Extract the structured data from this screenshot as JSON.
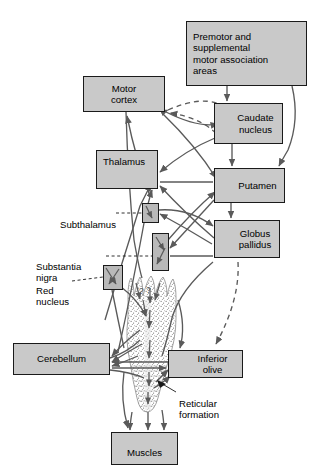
{
  "figure": {
    "kind": "neuroanatomy-pathway-diagram",
    "width": 323,
    "height": 469,
    "colors": {
      "box_fill": "#c9c9c9",
      "nucleus_fill": "#b9b9b9",
      "stroke": "#1a1a1a",
      "arrow": "#5a5a5a",
      "background": "#ffffff",
      "stipple": "#7a7a7a"
    }
  },
  "nodes": {
    "premotor": {
      "label": "Premotor and\nsupplemental\nmotor association\nareas"
    },
    "motor_cortex": {
      "label": "Motor\ncortex"
    },
    "caudate": {
      "label": "Caudate\nnucleus"
    },
    "thalamus": {
      "label": "Thalamus"
    },
    "putamen": {
      "label": "Putamen"
    },
    "globus_pallidus": {
      "label": "Globus\npallidus"
    },
    "cerebellum": {
      "label": "Cerebellum"
    },
    "inferior_olive": {
      "label": "Inferior\nolive"
    },
    "muscles": {
      "label": "Muscles"
    }
  },
  "nuclei": {
    "subthalamus": {
      "label": "Subthalamus"
    },
    "substantia_nigra": {
      "label": "Substantia\nnigra"
    },
    "red_nucleus": {
      "label": "Red\nnucleus"
    }
  },
  "annotations": {
    "reticular_formation": {
      "label": "Reticular\nformation"
    }
  },
  "icons": {
    "leader_line": "dashed-leader-line-icon",
    "arrowhead": "triangle-arrowhead-icon",
    "brainstem": "brainstem-spinal-cord-icon"
  }
}
